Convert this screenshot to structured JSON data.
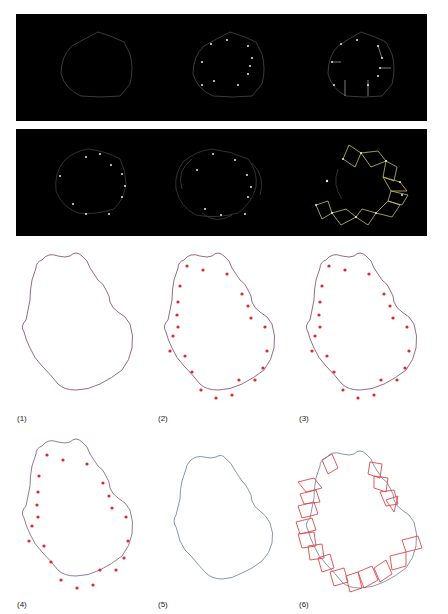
{
  "figure": {
    "top_strips": [
      {
        "name": "row-1",
        "panels": [
          "outline",
          "outline-with-points",
          "outline-with-normals"
        ]
      },
      {
        "name": "row-2",
        "panels": [
          "points-with-normals",
          "overlapping-curves",
          "square-tiles"
        ]
      }
    ],
    "colors": {
      "strip_background": "#000000",
      "strip_curve": "#5a5a5a",
      "strip_point": "#e8e8e8",
      "strip_square": "#c8c060",
      "outline_curve": "#8a5a7a",
      "outline_curve_alt": "#6c8ca0",
      "point": "#e02828",
      "square": "#e04848"
    },
    "panels": [
      {
        "label": "(1)"
      },
      {
        "label": "(2)"
      },
      {
        "label": "(3)"
      },
      {
        "label": "(4)"
      },
      {
        "label": "(5)"
      },
      {
        "label": "(6)"
      }
    ]
  }
}
